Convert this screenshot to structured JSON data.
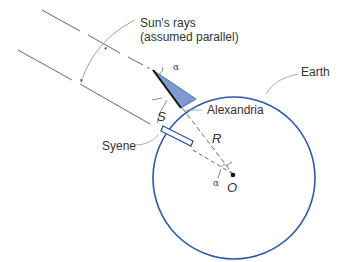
{
  "diagram": {
    "labels": {
      "rays": "Sun's rays",
      "rays_note": "(assumed parallel)",
      "earth": "Earth",
      "alexandria": "Alexandria",
      "syene": "Syene",
      "arc": "S",
      "radius": "R",
      "center": "O",
      "angle_top": "α",
      "angle_center": "α"
    },
    "colors": {
      "earth_outline": "#2d57a8",
      "gnomon_shadow": "#7d9bd1",
      "lines": "#555555",
      "text": "#333333"
    }
  }
}
